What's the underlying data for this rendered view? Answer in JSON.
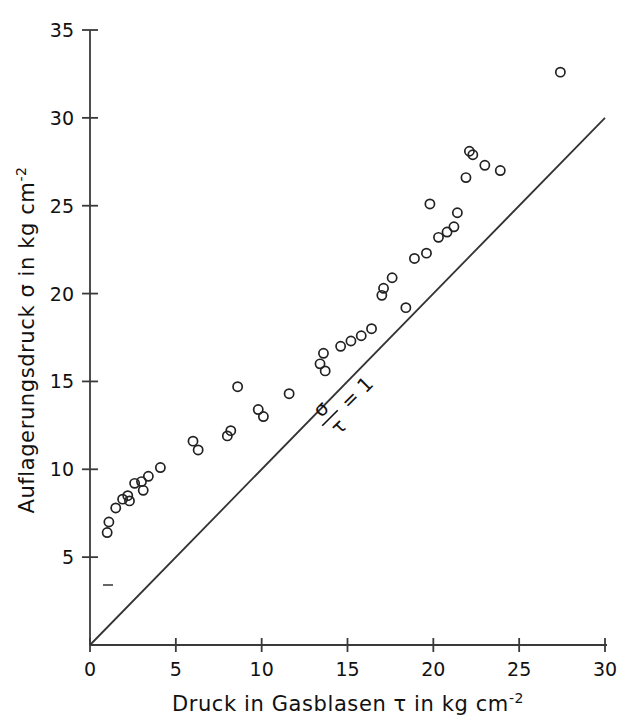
{
  "figure": {
    "background": "#ffffff",
    "ink_color": "#1a1a1a",
    "marker_color": "#222222"
  },
  "annotations": {
    "ratio_numerator": "σ",
    "ratio_denominator": "τ",
    "ratio_equals": "= 1",
    "ratio_full": "σ/τ = 1",
    "ratio_rotation_deg": -45
  },
  "chart_data": {
    "type": "scatter",
    "title": "",
    "xlabel": "Druck in Gasblasen τ in kg cm",
    "xlabel_exponent": "-2",
    "ylabel": "Auflagerungsdruck σ in kg cm",
    "ylabel_exponent": "-2",
    "xlim": [
      0,
      30
    ],
    "ylim": [
      0,
      35
    ],
    "xticks": [
      0,
      5,
      10,
      15,
      20,
      25,
      30
    ],
    "xticklabels": [
      "0",
      "5",
      "10",
      "15",
      "20",
      "25",
      "30"
    ],
    "yticks": [
      5,
      10,
      15,
      20,
      25,
      30,
      35
    ],
    "yticklabels": [
      "5",
      "10",
      "15",
      "20",
      "25",
      "30",
      "35"
    ],
    "grid": false,
    "legend": null,
    "marker": "open-circle",
    "reference_line": {
      "label": "σ/τ = 1",
      "slope": 1,
      "intercept": 0,
      "from": [
        0,
        0
      ],
      "to": [
        30,
        30
      ]
    },
    "points": [
      [
        1.0,
        6.4
      ],
      [
        1.1,
        7.0
      ],
      [
        1.5,
        7.8
      ],
      [
        1.9,
        8.3
      ],
      [
        2.2,
        8.5
      ],
      [
        2.3,
        8.2
      ],
      [
        2.6,
        9.2
      ],
      [
        3.0,
        9.3
      ],
      [
        3.1,
        8.8
      ],
      [
        3.4,
        9.6
      ],
      [
        4.1,
        10.1
      ],
      [
        6.0,
        11.6
      ],
      [
        6.3,
        11.1
      ],
      [
        8.0,
        11.9
      ],
      [
        8.2,
        12.2
      ],
      [
        8.6,
        14.7
      ],
      [
        9.8,
        13.4
      ],
      [
        10.1,
        13.0
      ],
      [
        11.6,
        14.3
      ],
      [
        13.4,
        16.0
      ],
      [
        13.6,
        16.6
      ],
      [
        13.7,
        15.6
      ],
      [
        14.6,
        17.0
      ],
      [
        15.2,
        17.3
      ],
      [
        15.8,
        17.6
      ],
      [
        16.4,
        18.0
      ],
      [
        17.0,
        19.9
      ],
      [
        17.1,
        20.3
      ],
      [
        17.6,
        20.9
      ],
      [
        18.4,
        19.2
      ],
      [
        18.9,
        22.0
      ],
      [
        19.6,
        22.3
      ],
      [
        19.8,
        25.1
      ],
      [
        20.3,
        23.2
      ],
      [
        20.8,
        23.5
      ],
      [
        21.2,
        23.8
      ],
      [
        21.4,
        24.6
      ],
      [
        21.9,
        26.6
      ],
      [
        22.1,
        28.1
      ],
      [
        22.3,
        27.9
      ],
      [
        23.0,
        27.3
      ],
      [
        23.9,
        27.0
      ],
      [
        27.4,
        32.6
      ]
    ]
  }
}
